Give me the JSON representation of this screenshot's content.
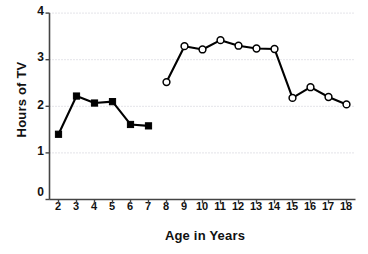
{
  "chart_data": {
    "type": "line",
    "title": "",
    "xlabel": "Age in Years",
    "ylabel": "Hours of TV",
    "xlim": [
      1.5,
      18.5
    ],
    "ylim": [
      0,
      4
    ],
    "grid": true,
    "legend": "none",
    "x_ticks": [
      "2",
      "3",
      "4",
      "5",
      "6",
      "7",
      "8",
      "9",
      "10",
      "11",
      "12",
      "13",
      "14",
      "15",
      "16",
      "17",
      "18"
    ],
    "y_ticks": [
      "0",
      "1",
      "2",
      "3",
      "4"
    ],
    "series": [
      {
        "name": "Ages 2-7",
        "marker": "filled-square",
        "color": "#000000",
        "x": [
          2,
          3,
          4,
          5,
          6,
          7
        ],
        "values": [
          1.4,
          2.22,
          2.07,
          2.1,
          1.61,
          1.58
        ]
      },
      {
        "name": "Ages 8-18",
        "marker": "open-circle",
        "color": "#000000",
        "x": [
          8,
          9,
          10,
          11,
          12,
          13,
          14,
          15,
          16,
          17,
          18
        ],
        "values": [
          2.52,
          3.29,
          3.22,
          3.42,
          3.3,
          3.24,
          3.23,
          2.18,
          2.41,
          2.2,
          2.04
        ]
      }
    ]
  }
}
